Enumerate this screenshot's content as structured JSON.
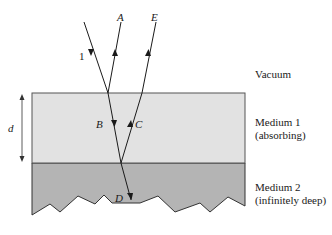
{
  "diagram": {
    "type": "thin-film-reflection-refraction",
    "colors": {
      "background": "#ffffff",
      "medium1": "#e2e2e2",
      "medium2": "#b4b4b4",
      "stroke": "#333333",
      "ray": "#1a1a1a"
    },
    "rays": {
      "incident": "1",
      "reflected_top": "A",
      "transmitted_down": "B",
      "reflected_up": "C",
      "transmitted_medium2": "D",
      "emergent": "E"
    },
    "thickness_label": "d",
    "regions": {
      "vacuum": "Vacuum",
      "medium1_line1": "Medium 1",
      "medium1_line2": "(absorbing)",
      "medium2_line1": "Medium 2",
      "medium2_line2": "(infinitely deep)"
    }
  }
}
